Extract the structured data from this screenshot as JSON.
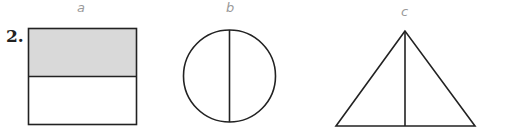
{
  "problem": {
    "number": "2.",
    "figures": [
      {
        "label": "a",
        "shape": "rectangle",
        "divided_into": 2,
        "shaded_parts": 1,
        "shade_color": "#d9d9d9"
      },
      {
        "label": "b",
        "shape": "circle",
        "divided_into": 2,
        "shaded_parts": 0
      },
      {
        "label": "c",
        "shape": "triangle",
        "divided_into": 2,
        "shaded_parts": 0
      }
    ]
  }
}
